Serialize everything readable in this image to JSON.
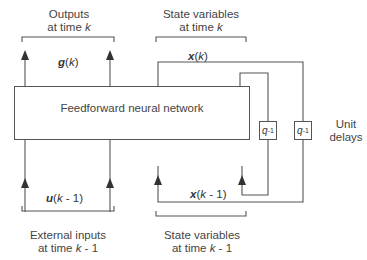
{
  "diagram": {
    "network_label": "Feedforward neural network",
    "top_left_group": {
      "line1": "Outputs",
      "line2_prefix": "at time ",
      "line2_var": "k"
    },
    "top_right_group": {
      "line1": "State variables",
      "line2_prefix": "at time ",
      "line2_var": "k"
    },
    "bottom_left_group": {
      "line1": "External inputs",
      "line2_prefix": "at time ",
      "line2_var": "k",
      "line2_suffix": " - 1"
    },
    "bottom_right_group": {
      "line1": "State variables",
      "line2_prefix": "at time ",
      "line2_var": "k",
      "line2_suffix": " - 1"
    },
    "output_signal": {
      "symbol": "g",
      "arg": "k"
    },
    "state_signal": {
      "symbol": "x",
      "arg": "k"
    },
    "input_signal": {
      "symbol": "u",
      "arg": "k",
      "arg_suffix": " - 1"
    },
    "prev_state_signal": {
      "symbol": "x",
      "arg": "k",
      "arg_suffix": " - 1"
    },
    "delay_label": {
      "base": "q",
      "exp": "-1"
    },
    "delays_caption": {
      "line1": "Unit",
      "line2": "delays"
    },
    "line_color": "#555555"
  }
}
